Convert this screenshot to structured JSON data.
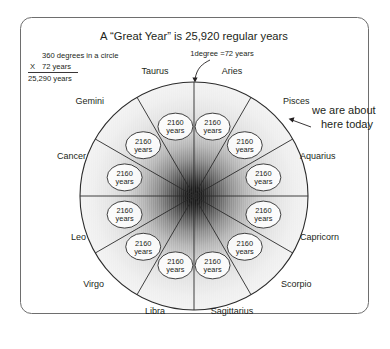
{
  "figure": {
    "title": "A “Great Year” is 25,920 regular years",
    "frame": {
      "border_color": "#6e6e6e"
    }
  },
  "calculation": {
    "line1": "360 degrees in a circle",
    "operator": "X",
    "line2": "72 years",
    "line2_unit": "years",
    "result": "25,290 years"
  },
  "annotations": {
    "degree_note": "1degree =72 years",
    "today_line1": "we are about",
    "today_line2": "here today"
  },
  "wheel": {
    "center_x": 194,
    "center_y": 196,
    "radius": 114,
    "segment_count": 12,
    "segment_value": "2160",
    "segment_unit": "years",
    "hub_color": "#1a1a1a",
    "edge_color": "#efefef",
    "segments": [
      {
        "sign": "Aries",
        "label_x": 232,
        "label_y": 74,
        "anchor": "middle"
      },
      {
        "sign": "Pisces",
        "label_x": 283,
        "label_y": 104,
        "anchor": "start"
      },
      {
        "sign": "Aquarius",
        "label_x": 300,
        "label_y": 159,
        "anchor": "start"
      },
      {
        "sign": "Capricorn",
        "label_x": 300,
        "label_y": 240,
        "anchor": "start"
      },
      {
        "sign": "Scorpio",
        "label_x": 281,
        "label_y": 287,
        "anchor": "start"
      },
      {
        "sign": "Sagittarius",
        "label_x": 232,
        "label_y": 314,
        "anchor": "middle"
      },
      {
        "sign": "Libra",
        "label_x": 155,
        "label_y": 314,
        "anchor": "middle"
      },
      {
        "sign": "Virgo",
        "label_x": 104,
        "label_y": 287,
        "anchor": "end"
      },
      {
        "sign": "Leo",
        "label_x": 86,
        "label_y": 240,
        "anchor": "end"
      },
      {
        "sign": "Cancer",
        "label_x": 86,
        "label_y": 159,
        "anchor": "end"
      },
      {
        "sign": "Gemini",
        "label_x": 104,
        "label_y": 104,
        "anchor": "end"
      },
      {
        "sign": "Taurus",
        "label_x": 155,
        "label_y": 74,
        "anchor": "middle"
      }
    ]
  }
}
